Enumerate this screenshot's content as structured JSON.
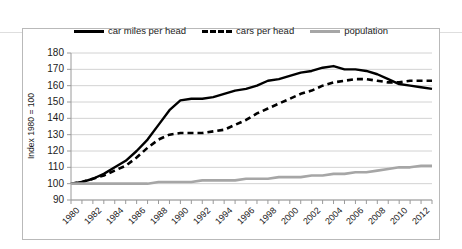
{
  "chart_data": {
    "type": "line",
    "title": "",
    "xlabel": "",
    "ylabel": "Index 1980 = 100",
    "ylim": [
      90,
      180
    ],
    "ytick_values": [
      90,
      100,
      110,
      120,
      130,
      140,
      150,
      160,
      170,
      180
    ],
    "xlim": [
      1980,
      2013
    ],
    "xtick_labels": [
      "1980",
      "1982",
      "1984",
      "1986",
      "1988",
      "1990",
      "1992",
      "1994",
      "1996",
      "1998",
      "2000",
      "2002",
      "2004",
      "2006",
      "2008",
      "2010",
      "2012"
    ],
    "grid": "horizontal",
    "legend_position": "top-center",
    "x": [
      1980,
      1981,
      1982,
      1983,
      1984,
      1985,
      1986,
      1987,
      1988,
      1989,
      1990,
      1991,
      1992,
      1993,
      1994,
      1995,
      1996,
      1997,
      1998,
      1999,
      2000,
      2001,
      2002,
      2003,
      2004,
      2005,
      2006,
      2007,
      2008,
      2009,
      2010,
      2011,
      2012,
      2013
    ],
    "series": [
      {
        "name": "car miles per head",
        "style": "solid",
        "color": "#000000",
        "values": [
          100,
          101,
          103,
          106,
          110,
          114,
          120,
          127,
          136,
          145,
          151,
          152,
          152,
          153,
          155,
          157,
          158,
          160,
          163,
          164,
          166,
          168,
          169,
          171,
          172,
          170,
          170,
          169,
          167,
          164,
          161,
          160,
          159,
          158
        ]
      },
      {
        "name": "cars per head",
        "style": "dashed",
        "color": "#000000",
        "values": [
          100,
          101,
          103,
          105,
          108,
          111,
          116,
          122,
          127,
          130,
          131,
          131,
          131,
          132,
          133,
          136,
          139,
          143,
          146,
          149,
          152,
          155,
          157,
          160,
          162,
          163,
          164,
          164,
          163,
          162,
          162,
          163,
          163,
          163
        ]
      },
      {
        "name": "population",
        "style": "solid",
        "color": "#a6a6a6",
        "values": [
          100,
          100,
          100,
          100,
          100,
          100,
          100,
          100,
          101,
          101,
          101,
          101,
          102,
          102,
          102,
          102,
          103,
          103,
          103,
          104,
          104,
          104,
          105,
          105,
          106,
          106,
          107,
          107,
          108,
          109,
          110,
          110,
          111,
          111
        ]
      }
    ]
  },
  "legend": {
    "items": [
      {
        "label": "car miles per head",
        "style": "solid"
      },
      {
        "label": "cars per head",
        "style": "dashed"
      },
      {
        "label": "population",
        "style": "gray"
      }
    ]
  },
  "axis": {
    "y_title": "Index 1980 = 100"
  }
}
